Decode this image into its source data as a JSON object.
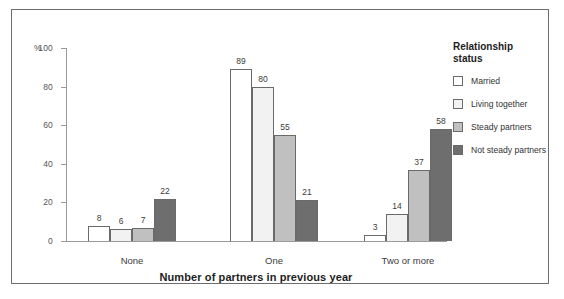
{
  "chart_data": {
    "type": "bar",
    "title": "",
    "subtitle": "",
    "xlabel": "Number of partners in previous year",
    "ylabel": "%",
    "ylim": [
      0,
      100
    ],
    "yticks": [
      0,
      20,
      40,
      60,
      80,
      100
    ],
    "ytick_labels": [
      "0",
      "20",
      "40",
      "60",
      "80",
      "100"
    ],
    "y_unit_label": "%",
    "grid": false,
    "categories": [
      "None",
      "One",
      "Two or more"
    ],
    "legend_title": "Relationship\nstatus",
    "legend_position": "right",
    "series": [
      {
        "name": "Married",
        "values": [
          8,
          6,
          3
        ],
        "color": "#ffffff"
      },
      {
        "name": "Living together",
        "values": [
          6,
          80,
          14
        ],
        "color": "#f2f2f2"
      },
      {
        "name": "Steady partners",
        "values": [
          7,
          55,
          37
        ],
        "color": "#c0c0c0"
      },
      {
        "name": "Not steady partners",
        "values": [
          22,
          21,
          58
        ],
        "color": "#6e6e6e"
      }
    ],
    "bar_labels": [
      [
        8,
        6,
        7,
        22
      ],
      [
        89,
        80,
        55,
        21
      ],
      [
        3,
        14,
        37,
        58
      ]
    ],
    "note_married_values": [
      8,
      89,
      3
    ]
  },
  "axis": {
    "unit": "%",
    "ticks": [
      {
        "label": "100",
        "value": 100
      },
      {
        "label": "80",
        "value": 80
      },
      {
        "label": "60",
        "value": 60
      },
      {
        "label": "40",
        "value": 40
      },
      {
        "label": "20",
        "value": 20
      },
      {
        "label": "0",
        "value": 0
      }
    ]
  },
  "groups": [
    {
      "label": "None",
      "center": 120,
      "bars": [
        {
          "series": "Married",
          "value": 8,
          "label": "8",
          "color": "#ffffff"
        },
        {
          "series": "Living together",
          "value": 6,
          "label": "6",
          "color": "#f2f2f2"
        },
        {
          "series": "Steady partners",
          "value": 7,
          "label": "7",
          "color": "#c0c0c0"
        },
        {
          "series": "Not steady partners",
          "value": 22,
          "label": "22",
          "color": "#6e6e6e"
        }
      ]
    },
    {
      "label": "One",
      "center": 262,
      "bars": [
        {
          "series": "Married",
          "value": 89,
          "label": "89",
          "color": "#ffffff"
        },
        {
          "series": "Living together",
          "value": 80,
          "label": "80",
          "color": "#f2f2f2"
        },
        {
          "series": "Steady partners",
          "value": 55,
          "label": "55",
          "color": "#c0c0c0"
        },
        {
          "series": "Not steady partners",
          "value": 21,
          "label": "21",
          "color": "#6e6e6e"
        }
      ]
    },
    {
      "label": "Two or more",
      "center": 396,
      "bars": [
        {
          "series": "Married",
          "value": 3,
          "label": "3",
          "color": "#ffffff"
        },
        {
          "series": "Living together",
          "value": 14,
          "label": "14",
          "color": "#f2f2f2"
        },
        {
          "series": "Steady partners",
          "value": 37,
          "label": "37",
          "color": "#c0c0c0"
        },
        {
          "series": "Not steady partners",
          "value": 58,
          "label": "58",
          "color": "#6e6e6e"
        }
      ]
    }
  ],
  "legend": {
    "title": "Relationship\nstatus",
    "items": [
      {
        "label": "Married",
        "color": "#ffffff"
      },
      {
        "label": "Living together",
        "color": "#f2f2f2"
      },
      {
        "label": "Steady partners",
        "color": "#c0c0c0"
      },
      {
        "label": "Not steady partners",
        "color": "#6e6e6e"
      }
    ]
  },
  "x_axis_title": "Number of partners in previous year",
  "colors": {
    "frame": "#6d6d6d",
    "axis": "#9a9a9a",
    "bar_outline": "#6a6a6a",
    "text": "#3b3b3b",
    "title_text": "#1d1d1d"
  }
}
